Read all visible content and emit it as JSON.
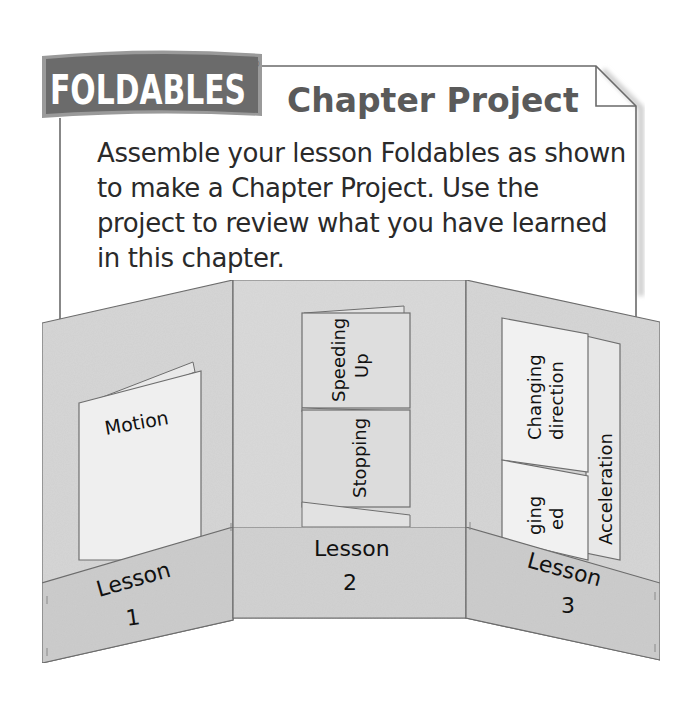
{
  "header": {
    "logo": "FOLDABLES",
    "registered_mark": "®",
    "title": "Chapter Project"
  },
  "instructions": "Assemble your lesson Foldables as shown to make a Chapter Project. Use the project to review what you have learned in this chapter.",
  "panels": [
    {
      "pocket_label": "Lesson",
      "pocket_number": "1",
      "booklets": [
        "Motion"
      ]
    },
    {
      "pocket_label": "Lesson",
      "pocket_number": "2",
      "booklets": [
        "Speeding",
        "Up",
        "Stopping"
      ]
    },
    {
      "pocket_label": "Lesson",
      "pocket_number": "3",
      "booklets": [
        "Changing",
        "direction",
        "ging",
        "ed",
        "Acceleration"
      ]
    }
  ],
  "colors": {
    "panel_fill": "#d4d4d4",
    "pocket_fill": "#cbcbcb",
    "booklet_fill": "#ececec",
    "outline": "#6e6e6e",
    "logo_fill": "#6b6b6b"
  }
}
